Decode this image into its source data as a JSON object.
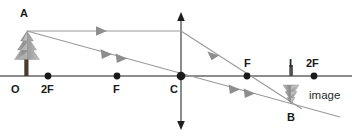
{
  "diagram": {
    "colors": {
      "axis": "#8c8c8c",
      "ray": "#9a9a9a",
      "point": "#1a1a1a",
      "label": "#1a1a1a",
      "object_tree": "#9d9d9d",
      "object_trunk": "#4a3b2f",
      "background": "#ffffff"
    },
    "labels": [
      {
        "name": "label-A",
        "text": "A",
        "x": 20,
        "y": 8,
        "bold": true
      },
      {
        "name": "label-O",
        "text": "O",
        "x": 11,
        "y": 84,
        "bold": true
      },
      {
        "name": "label-2F-left",
        "text": "2F",
        "x": 41,
        "y": 84,
        "bold": true
      },
      {
        "name": "label-F-left",
        "text": "F",
        "x": 113,
        "y": 84,
        "bold": true
      },
      {
        "name": "label-C",
        "text": "C",
        "x": 169,
        "y": 84,
        "bold": true
      },
      {
        "name": "label-F-right",
        "text": "F",
        "x": 243,
        "y": 58,
        "bold": true
      },
      {
        "name": "label-I",
        "text": "I",
        "x": 289,
        "y": 58,
        "bold": true
      },
      {
        "name": "label-2F-right",
        "text": "2F",
        "x": 306,
        "y": 58,
        "bold": true
      },
      {
        "name": "label-B",
        "text": "B",
        "x": 287,
        "y": 113,
        "bold": true
      },
      {
        "name": "label-image",
        "text": "image",
        "x": 310,
        "y": 91,
        "bold": false
      }
    ],
    "points": [
      {
        "name": "point-2F-left",
        "x": 48,
        "y": 76,
        "r": 3.4
      },
      {
        "name": "point-F-left",
        "x": 117,
        "y": 76,
        "r": 3.4
      },
      {
        "name": "point-C",
        "x": 181,
        "y": 76,
        "r": 4.2
      },
      {
        "name": "point-F-right",
        "x": 247,
        "y": 76,
        "r": 3.4
      },
      {
        "name": "point-2F-right",
        "x": 314,
        "y": 76,
        "r": 3.4
      }
    ],
    "principal_axis": {
      "name": "principal-axis",
      "x1": 0,
      "y1": 76,
      "x2": 352,
      "y2": 76
    },
    "lens_axis": {
      "name": "lens-vertical-axis",
      "x": 181,
      "y_top": 13,
      "y_bottom": 129
    },
    "object": {
      "name": "object-tree",
      "base_x": 27,
      "base_y": 76,
      "top_x": 27,
      "top_y": 31,
      "height": 45,
      "description": "upright tree at O"
    },
    "image": {
      "name": "image-tree",
      "base_x": 291,
      "base_y": 76,
      "tip_x": 291,
      "tip_y": 104,
      "height": 28,
      "description": "inverted tree at I"
    },
    "rays": [
      {
        "name": "ray-parallel-incident",
        "from": [
          27,
          31
        ],
        "to": [
          181,
          31
        ],
        "arrows": [
          {
            "x": 100,
            "y": 31,
            "angle": 0
          }
        ]
      },
      {
        "name": "ray-parallel-refracted",
        "from": [
          181,
          31
        ],
        "to": [
          300,
          108
        ],
        "arrows": [
          {
            "x": 214,
            "y": 52,
            "angle": 33
          }
        ]
      },
      {
        "name": "ray-through-center",
        "from": [
          27,
          31
        ],
        "to": [
          313,
          110
        ],
        "arrows": [
          {
            "x": 103,
            "y": 52,
            "angle": 15
          },
          {
            "x": 118,
            "y": 56,
            "angle": 15
          },
          {
            "x": 231,
            "y": 87,
            "angle": 15
          },
          {
            "x": 246,
            "y": 91,
            "angle": 15
          }
        ]
      }
    ]
  }
}
